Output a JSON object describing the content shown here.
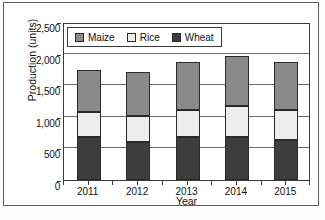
{
  "chart_data": {
    "type": "bar",
    "subtype": "stacked-bar",
    "title": "",
    "xlabel": "Year",
    "ylabel": "Production (units)",
    "categories": [
      "2011",
      "2012",
      "2013",
      "2014",
      "2015"
    ],
    "ylim": [
      0,
      2500
    ],
    "yticks": [
      0,
      500,
      1000,
      1500,
      2000,
      2500
    ],
    "ytick_labels": [
      "0",
      "500",
      "1,000",
      "1,500",
      "2,000",
      "2,500"
    ],
    "grid": true,
    "grid_axis": "y",
    "legend_position": "top-left-inside",
    "stack_order_bottom_to_top": [
      "Wheat",
      "Rice",
      "Maize"
    ],
    "series": [
      {
        "name": "Maize",
        "color": "#8a8a8a",
        "values": [
          660,
          700,
          765,
          790,
          765
        ]
      },
      {
        "name": "Rice",
        "color": "#ededed",
        "values": [
          400,
          415,
          430,
          485,
          470
        ]
      },
      {
        "name": "Wheat",
        "color": "#3d3d3d",
        "values": [
          680,
          595,
          680,
          685,
          640
        ]
      }
    ],
    "cumulative_tops": {
      "Wheat": [
        680,
        595,
        680,
        685,
        640
      ],
      "Rice": [
        1080,
        1010,
        1110,
        1170,
        1110
      ],
      "Maize": [
        1740,
        1710,
        1875,
        1960,
        1875
      ]
    },
    "totals": [
      1740,
      1710,
      1875,
      1960,
      1875
    ]
  },
  "legend": {
    "items": [
      {
        "label": "Maize",
        "color": "#8a8a8a"
      },
      {
        "label": "Rice",
        "color": "#ededed"
      },
      {
        "label": "Wheat",
        "color": "#3d3d3d"
      }
    ]
  },
  "axes": {
    "y_title": "Production (units)",
    "x_title": "Year"
  }
}
